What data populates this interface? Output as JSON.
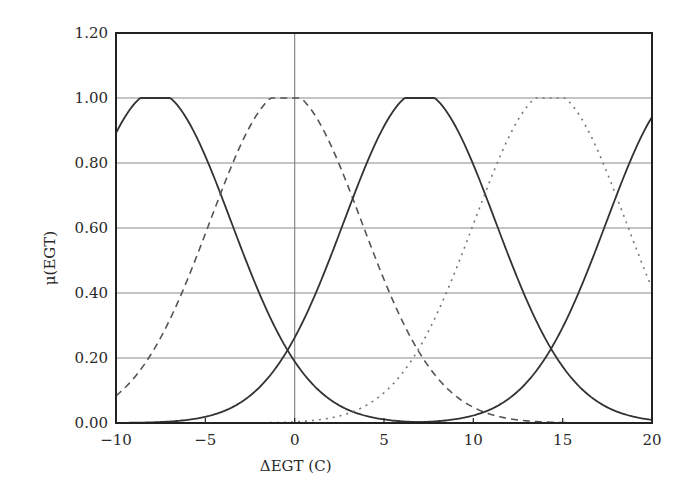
{
  "chart_data": {
    "type": "line",
    "title": "",
    "xlabel": "ΔEGT (C)",
    "ylabel": "μ(EGT)",
    "xlim": [
      -10,
      20
    ],
    "ylim": [
      0,
      1.2
    ],
    "x_ticks": [
      -10,
      -5,
      0,
      5,
      10,
      15,
      20
    ],
    "x_tick_labels": [
      "−10",
      "−5",
      "0",
      "5",
      "10",
      "15",
      "20"
    ],
    "y_ticks": [
      0,
      0.2,
      0.4,
      0.6,
      0.8,
      1.0,
      1.2
    ],
    "y_tick_labels": [
      "0.00",
      "0.20",
      "0.40",
      "0.60",
      "0.80",
      "1.00",
      "1.20"
    ],
    "grid": {
      "horizontal": true,
      "vertical_at": [
        0
      ]
    },
    "legend": null,
    "series": [
      {
        "name": "MF1",
        "shape": "gaussian",
        "center": -7.8,
        "sigma": 4.25,
        "style": "solid",
        "color": "#333333"
      },
      {
        "name": "MF2",
        "shape": "gaussian",
        "center": -0.5,
        "sigma": 4.25,
        "style": "dashed",
        "color": "#555555"
      },
      {
        "name": "MF3",
        "shape": "gaussian",
        "center": 7.0,
        "sigma": 4.25,
        "style": "solid",
        "color": "#333333"
      },
      {
        "name": "MF4",
        "shape": "gaussian",
        "center": 14.3,
        "sigma": 4.25,
        "style": "dotted",
        "color": "#777777"
      },
      {
        "name": "MF5",
        "shape": "gaussian",
        "center": 21.7,
        "sigma": 4.25,
        "style": "solid",
        "color": "#333333"
      }
    ],
    "sample_points": {
      "x": [
        -10,
        -5,
        0,
        5,
        10,
        15,
        20
      ],
      "MF1": [
        0.88,
        0.8,
        0.19,
        0.01,
        0.0,
        0.0,
        0.0
      ],
      "MF2": [
        0.08,
        0.63,
        0.99,
        0.57,
        0.07,
        0.0,
        0.0
      ],
      "MF3": [
        0.01,
        0.08,
        0.26,
        0.89,
        0.78,
        0.21,
        0.01
      ],
      "MF4": [
        0.0,
        0.0,
        0.01,
        0.09,
        0.6,
        0.99,
        0.41
      ],
      "MF5": [
        0.0,
        0.0,
        0.0,
        0.0,
        0.09,
        0.29,
        0.93
      ]
    }
  }
}
